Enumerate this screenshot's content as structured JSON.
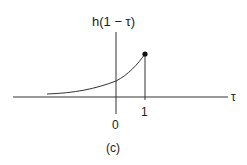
{
  "figure": {
    "caption": "(c)",
    "y_label": "h(1 − τ)",
    "x_axis_label": "τ",
    "ticks": [
      {
        "label": "0",
        "position": 0
      },
      {
        "label": "1",
        "position": 1
      }
    ],
    "curve": {
      "description": "exponentially increasing curve for τ < 1, ending at a filled dot at τ = 1, then dropping vertically to zero",
      "endpoint": "filled-dot at τ = 1"
    },
    "colors": {
      "line": "#333333",
      "background": "#ffffff"
    }
  }
}
